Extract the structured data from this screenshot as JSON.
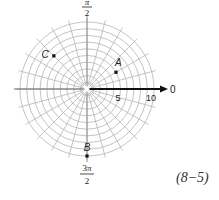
{
  "diagram": {
    "type": "polar-grid",
    "center": {
      "x": 87,
      "y": 89
    },
    "max_radius_units": 10,
    "pixels_per_unit": 6.7,
    "circle_count": 10,
    "spoke_count": 24,
    "grid_color": "#b5b5b5",
    "axis_color": "#111111",
    "angle_labels": {
      "top_numerator": "π",
      "top_denominator": "2",
      "bottom_numerator": "3π",
      "bottom_denominator": "2",
      "right": "0"
    },
    "radius_labels": [
      "5",
      "10"
    ],
    "points": [
      {
        "label": "A",
        "r": 5,
        "theta_deg": 30
      },
      {
        "label": "B",
        "r": 10,
        "theta_deg": 270
      },
      {
        "label": "C",
        "r": 7,
        "theta_deg": 135
      }
    ]
  },
  "reference": "(8−5)"
}
